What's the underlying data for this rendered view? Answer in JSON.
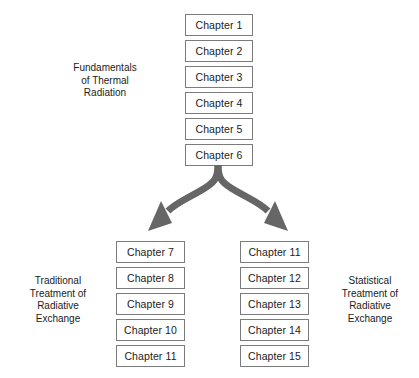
{
  "diagram": {
    "title_text": "Thermal Radiation Textbook Chapter Organization",
    "colors": {
      "box_border": "#7b7b7b",
      "box_fill": "#ffffff",
      "text": "#1b1b1b",
      "arrow": "#666666",
      "background": "#ffffff"
    },
    "top_group": {
      "label": "Fundamentals\nof Thermal\nRadiation",
      "label_lines": [
        "Fundamentals",
        "of Thermal",
        "Radiation"
      ],
      "boxes": [
        {
          "label": "Chapter 1"
        },
        {
          "label": "Chapter 2"
        },
        {
          "label": "Chapter 3"
        },
        {
          "label": "Chapter 4"
        },
        {
          "label": "Chapter 5"
        },
        {
          "label": "Chapter 6"
        }
      ]
    },
    "left_group": {
      "label": "Traditional\nTreatment of\nRadiative\nExchange",
      "label_lines": [
        "Traditional",
        "Treatment of",
        "Radiative",
        "Exchange"
      ],
      "boxes": [
        {
          "label": "Chapter 7"
        },
        {
          "label": "Chapter 8"
        },
        {
          "label": "Chapter 9"
        },
        {
          "label": "Chapter 10"
        },
        {
          "label": "Chapter 11"
        }
      ]
    },
    "right_group": {
      "label": "Statistical\nTreatment of\nRadiative\nExchange",
      "label_lines": [
        "Statistical",
        "Treatment of",
        "Radiative",
        "Exchange"
      ],
      "boxes": [
        {
          "label": "Chapter 11"
        },
        {
          "label": "Chapter 12"
        },
        {
          "label": "Chapter 13"
        },
        {
          "label": "Chapter 14"
        },
        {
          "label": "Chapter 15"
        }
      ]
    },
    "connector": {
      "type": "forked-split-arrow",
      "from": "Chapter 6",
      "to": [
        "Chapter 7",
        "Chapter 11"
      ],
      "branches": 2
    }
  }
}
